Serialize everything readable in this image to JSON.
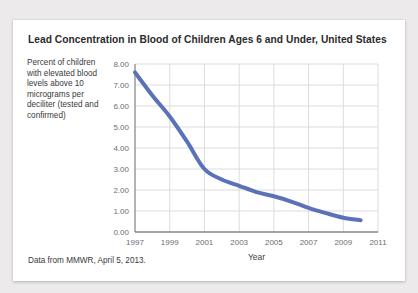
{
  "card": {
    "title": "Lead Concentration in Blood of Children Ages 6 and Under, United States",
    "source_note": "Data from MMWR, April 5, 2013."
  },
  "y_axis_description": "Percent of children with elevated blood levels above 10 micrograms per deciliter (tested and confirmed)",
  "chart_data": {
    "type": "line",
    "title": "Lead Concentration in Blood of Children Ages 6 and Under, United States",
    "xlabel": "Year",
    "ylabel": "Percent of children with elevated blood levels above 10 micrograms per deciliter (tested and confirmed)",
    "xlim": [
      1997,
      2011
    ],
    "ylim": [
      0.0,
      8.0
    ],
    "xticks": [
      1997,
      1999,
      2001,
      2003,
      2005,
      2007,
      2009,
      2011
    ],
    "xtick_labels": [
      "1997",
      "1999",
      "2001",
      "2003",
      "2005",
      "2007",
      "2009",
      "2011"
    ],
    "yticks": [
      0.0,
      1.0,
      2.0,
      3.0,
      4.0,
      5.0,
      6.0,
      7.0,
      8.0
    ],
    "ytick_labels": [
      "0.00",
      "1.00",
      "2.00",
      "3.00",
      "4.00",
      "5.00",
      "6.00",
      "7.00",
      "8.00"
    ],
    "grid": true,
    "legend": "none",
    "line_color": "#5b72b8",
    "line_width": 4,
    "x": [
      1997,
      1998,
      1999,
      2000,
      2001,
      2002,
      2003,
      2004,
      2005,
      2006,
      2007,
      2008,
      2009,
      2010
    ],
    "values": [
      7.6,
      6.5,
      5.5,
      4.3,
      3.0,
      2.5,
      2.2,
      1.9,
      1.7,
      1.45,
      1.15,
      0.9,
      0.68,
      0.56
    ],
    "series": [
      {
        "name": "Percent of children with elevated blood lead levels",
        "values": [
          7.6,
          6.5,
          5.5,
          4.3,
          3.0,
          2.5,
          2.2,
          1.9,
          1.7,
          1.45,
          1.15,
          0.9,
          0.68,
          0.56
        ]
      }
    ]
  }
}
